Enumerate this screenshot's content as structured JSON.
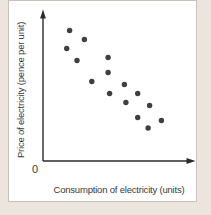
{
  "chart_data": {
    "type": "scatter",
    "title": "",
    "xlabel": "Consumption of electricity (units)",
    "ylabel": "Price of electricity (pence per unit)",
    "origin_label": "0",
    "xlim": [
      0,
      10
    ],
    "ylim": [
      0,
      10
    ],
    "grid": false,
    "legend": "none",
    "axis_ticks": "none",
    "points": [
      {
        "x": 1.8,
        "y": 8.7
      },
      {
        "x": 2.8,
        "y": 8.1
      },
      {
        "x": 1.6,
        "y": 7.5
      },
      {
        "x": 2.3,
        "y": 6.7
      },
      {
        "x": 4.4,
        "y": 6.9
      },
      {
        "x": 4.4,
        "y": 5.9
      },
      {
        "x": 3.3,
        "y": 5.3
      },
      {
        "x": 5.5,
        "y": 5.1
      },
      {
        "x": 6.4,
        "y": 4.5
      },
      {
        "x": 4.5,
        "y": 4.5
      },
      {
        "x": 5.6,
        "y": 3.9
      },
      {
        "x": 7.2,
        "y": 3.7
      },
      {
        "x": 6.4,
        "y": 2.9
      },
      {
        "x": 8.0,
        "y": 2.7
      },
      {
        "x": 7.1,
        "y": 2.2
      }
    ],
    "colors": {
      "point": "#3f3f3f",
      "axis": "#2b2b2b",
      "panel_background": "#ffffff",
      "outer_background": "#ebe5de",
      "panel_border": "#c8c2bb",
      "label_text": "#3a3a3a"
    }
  }
}
